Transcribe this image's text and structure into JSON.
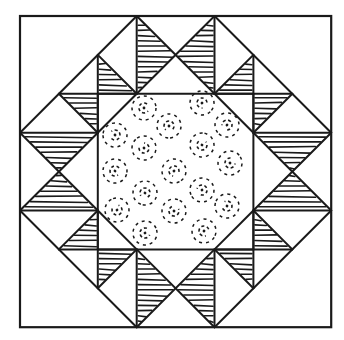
{
  "diagram": {
    "type": "quilt-block",
    "colors": {
      "background": "#ffffff",
      "line": "#1a1a1a"
    },
    "grid": {
      "origin": [
        20,
        16
      ],
      "unit": 38.9,
      "divisions": 8
    },
    "outer_square": [
      [
        0,
        0
      ],
      [
        8,
        8
      ]
    ],
    "center_region": {
      "label": "dotted-center-octagon",
      "polygon": [
        [
          3,
          2
        ],
        [
          5,
          2
        ],
        [
          6,
          3
        ],
        [
          6,
          5
        ],
        [
          5,
          6
        ],
        [
          3,
          6
        ],
        [
          2,
          5
        ],
        [
          2,
          3
        ]
      ],
      "square": [
        [
          2,
          2
        ],
        [
          6,
          6
        ]
      ],
      "motif": "dashed-swirl-circles",
      "motif_positions_px": [
        [
          144,
          108
        ],
        [
          202,
          103
        ],
        [
          169,
          126
        ],
        [
          227,
          125
        ],
        [
          115,
          135
        ],
        [
          144,
          148
        ],
        [
          202,
          145
        ],
        [
          230,
          163
        ],
        [
          115,
          171
        ],
        [
          174,
          171
        ],
        [
          145,
          193
        ],
        [
          202,
          190
        ],
        [
          227,
          206
        ],
        [
          117,
          210
        ],
        [
          174,
          211
        ],
        [
          145,
          233
        ],
        [
          204,
          231
        ]
      ]
    },
    "lines": [
      [
        [
          3,
          0
        ],
        [
          0,
          3
        ]
      ],
      [
        [
          5,
          0
        ],
        [
          8,
          3
        ]
      ],
      [
        [
          0,
          5
        ],
        [
          3,
          8
        ]
      ],
      [
        [
          8,
          5
        ],
        [
          5,
          8
        ]
      ],
      [
        [
          3,
          0
        ],
        [
          3,
          2
        ]
      ],
      [
        [
          5,
          0
        ],
        [
          5,
          2
        ]
      ],
      [
        [
          3,
          0
        ],
        [
          5,
          2
        ]
      ],
      [
        [
          5,
          0
        ],
        [
          3,
          2
        ]
      ],
      [
        [
          3,
          6
        ],
        [
          3,
          8
        ]
      ],
      [
        [
          5,
          6
        ],
        [
          5,
          8
        ]
      ],
      [
        [
          3,
          6
        ],
        [
          5,
          8
        ]
      ],
      [
        [
          5,
          6
        ],
        [
          3,
          8
        ]
      ],
      [
        [
          0,
          3
        ],
        [
          2,
          3
        ]
      ],
      [
        [
          0,
          5
        ],
        [
          2,
          5
        ]
      ],
      [
        [
          0,
          3
        ],
        [
          2,
          5
        ]
      ],
      [
        [
          0,
          5
        ],
        [
          2,
          3
        ]
      ],
      [
        [
          6,
          3
        ],
        [
          8,
          3
        ]
      ],
      [
        [
          6,
          5
        ],
        [
          8,
          5
        ]
      ],
      [
        [
          6,
          3
        ],
        [
          8,
          5
        ]
      ],
      [
        [
          6,
          5
        ],
        [
          8,
          3
        ]
      ],
      [
        [
          2,
          1
        ],
        [
          2,
          3
        ]
      ],
      [
        [
          1,
          2
        ],
        [
          3,
          2
        ]
      ],
      [
        [
          2,
          1
        ],
        [
          3,
          2
        ]
      ],
      [
        [
          1,
          2
        ],
        [
          2,
          3
        ]
      ],
      [
        [
          6,
          1
        ],
        [
          6,
          3
        ]
      ],
      [
        [
          5,
          2
        ],
        [
          7,
          2
        ]
      ],
      [
        [
          6,
          1
        ],
        [
          5,
          2
        ]
      ],
      [
        [
          7,
          2
        ],
        [
          6,
          3
        ]
      ],
      [
        [
          2,
          5
        ],
        [
          2,
          7
        ]
      ],
      [
        [
          1,
          6
        ],
        [
          3,
          6
        ]
      ],
      [
        [
          1,
          6
        ],
        [
          2,
          5
        ]
      ],
      [
        [
          2,
          7
        ],
        [
          3,
          6
        ]
      ],
      [
        [
          6,
          5
        ],
        [
          6,
          7
        ]
      ],
      [
        [
          5,
          6
        ],
        [
          7,
          6
        ]
      ],
      [
        [
          6,
          5
        ],
        [
          7,
          6
        ]
      ],
      [
        [
          5,
          6
        ],
        [
          6,
          7
        ]
      ],
      [
        [
          2,
          2
        ],
        [
          6,
          2
        ]
      ],
      [
        [
          2,
          6
        ],
        [
          6,
          6
        ]
      ],
      [
        [
          2,
          2
        ],
        [
          2,
          6
        ]
      ],
      [
        [
          6,
          2
        ],
        [
          6,
          6
        ]
      ],
      [
        [
          3,
          2
        ],
        [
          2,
          3
        ]
      ],
      [
        [
          5,
          2
        ],
        [
          6,
          3
        ]
      ],
      [
        [
          2,
          5
        ],
        [
          3,
          6
        ]
      ],
      [
        [
          6,
          5
        ],
        [
          5,
          6
        ]
      ]
    ],
    "hatched_triangles": [
      {
        "name": "top-left-goose",
        "points": [
          [
            3,
            0
          ],
          [
            3,
            2
          ],
          [
            4,
            1
          ]
        ],
        "orient": "h"
      },
      {
        "name": "top-right-goose",
        "points": [
          [
            5,
            0
          ],
          [
            5,
            2
          ],
          [
            4,
            1
          ]
        ],
        "orient": "h"
      },
      {
        "name": "bottom-left-goose",
        "points": [
          [
            3,
            6
          ],
          [
            3,
            8
          ],
          [
            4,
            7
          ]
        ],
        "orient": "h"
      },
      {
        "name": "bottom-right-goose",
        "points": [
          [
            5,
            6
          ],
          [
            5,
            8
          ],
          [
            4,
            7
          ]
        ],
        "orient": "h"
      },
      {
        "name": "left-top-goose",
        "points": [
          [
            0,
            3
          ],
          [
            2,
            3
          ],
          [
            1,
            4
          ]
        ],
        "orient": "h"
      },
      {
        "name": "left-bottom-goose",
        "points": [
          [
            0,
            5
          ],
          [
            2,
            5
          ],
          [
            1,
            4
          ]
        ],
        "orient": "h"
      },
      {
        "name": "right-top-goose",
        "points": [
          [
            6,
            3
          ],
          [
            8,
            3
          ],
          [
            7,
            4
          ]
        ],
        "orient": "h"
      },
      {
        "name": "right-bottom-goose",
        "points": [
          [
            6,
            5
          ],
          [
            8,
            5
          ],
          [
            7,
            4
          ]
        ],
        "orient": "h"
      },
      {
        "name": "nw-upper",
        "points": [
          [
            2,
            1
          ],
          [
            2,
            2
          ],
          [
            3,
            2
          ]
        ],
        "orient": "h"
      },
      {
        "name": "nw-lower",
        "points": [
          [
            1,
            2
          ],
          [
            2,
            2
          ],
          [
            2,
            3
          ]
        ],
        "orient": "h"
      },
      {
        "name": "ne-upper",
        "points": [
          [
            6,
            1
          ],
          [
            6,
            2
          ],
          [
            5,
            2
          ]
        ],
        "orient": "h"
      },
      {
        "name": "ne-lower",
        "points": [
          [
            6,
            2
          ],
          [
            7,
            2
          ],
          [
            6,
            3
          ]
        ],
        "orient": "h"
      },
      {
        "name": "sw-upper",
        "points": [
          [
            2,
            5
          ],
          [
            2,
            6
          ],
          [
            1,
            6
          ]
        ],
        "orient": "h"
      },
      {
        "name": "sw-lower",
        "points": [
          [
            2,
            6
          ],
          [
            2,
            7
          ],
          [
            3,
            6
          ]
        ],
        "orient": "h"
      },
      {
        "name": "se-upper",
        "points": [
          [
            6,
            5
          ],
          [
            6,
            6
          ],
          [
            7,
            6
          ]
        ],
        "orient": "h"
      },
      {
        "name": "se-lower",
        "points": [
          [
            6,
            6
          ],
          [
            6,
            7
          ],
          [
            5,
            6
          ]
        ],
        "orient": "h"
      }
    ]
  }
}
